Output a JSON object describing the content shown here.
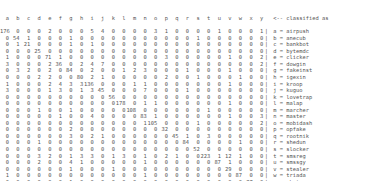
{
  "header": {
    "columns": [
      "a",
      "b",
      "c",
      "d",
      "e",
      "f",
      "g",
      "h",
      "i",
      "j",
      "k",
      "l",
      "m",
      "n",
      "o",
      "p",
      "q",
      "r",
      "s",
      "t",
      "u",
      "v",
      "w",
      "x",
      "y"
    ],
    "trailer": "<-- classified as"
  },
  "rows": [
    {
      "key": "a",
      "name": "airpush",
      "values": [
        176,
        0,
        0,
        0,
        2,
        0,
        0,
        0,
        5,
        4,
        0,
        0,
        0,
        0,
        3,
        1,
        0,
        0,
        0,
        0,
        1,
        0,
        0,
        0,
        1
      ]
    },
    {
      "key": "b",
      "name": "anecub",
      "values": [
        0,
        54,
        1,
        0,
        0,
        0,
        1,
        0,
        0,
        0,
        0,
        0,
        0,
        0,
        0,
        0,
        0,
        0,
        1,
        0,
        0,
        0,
        0,
        0,
        0
      ]
    },
    {
      "key": "c",
      "name": "bankbot",
      "values": [
        0,
        1,
        21,
        0,
        0,
        0,
        1,
        0,
        1,
        0,
        0,
        0,
        0,
        0,
        0,
        0,
        0,
        0,
        0,
        0,
        0,
        0,
        0,
        0,
        0
      ]
    },
    {
      "key": "d",
      "name": "bytemdc",
      "values": [
        0,
        0,
        0,
        25,
        0,
        0,
        0,
        0,
        0,
        0,
        0,
        0,
        0,
        0,
        0,
        0,
        0,
        0,
        0,
        0,
        0,
        0,
        0,
        0,
        0
      ]
    },
    {
      "key": "e",
      "name": "clicker",
      "values": [
        1,
        0,
        0,
        0,
        71,
        1,
        0,
        0,
        0,
        0,
        0,
        0,
        0,
        0,
        0,
        3,
        0,
        0,
        0,
        0,
        0,
        1,
        0,
        0,
        2
      ]
    },
    {
      "key": "f",
      "name": "dowgin",
      "values": [
        3,
        0,
        0,
        0,
        2,
        36,
        0,
        2,
        4,
        7,
        0,
        0,
        0,
        0,
        0,
        0,
        0,
        0,
        0,
        0,
        0,
        0,
        0,
        0,
        2
      ]
    },
    {
      "key": "g",
      "name": "fakeinst",
      "values": [
        0,
        3,
        2,
        0,
        2,
        0,
        84,
        0,
        2,
        0,
        0,
        1,
        2,
        3,
        0,
        0,
        0,
        1,
        0,
        0,
        0,
        1,
        0,
        0,
        0
      ]
    },
    {
      "key": "h",
      "name": "igexin",
      "values": [
        0,
        0,
        0,
        2,
        2,
        0,
        0,
        80,
        2,
        1,
        0,
        0,
        0,
        0,
        0,
        2,
        0,
        0,
        1,
        0,
        0,
        0,
        1,
        0,
        0
      ]
    },
    {
      "key": "i",
      "name": "kroop",
      "values": [
        1,
        0,
        0,
        0,
        2,
        4,
        3,
        3,
        136,
        0,
        0,
        0,
        1,
        1,
        0,
        0,
        0,
        0,
        0,
        0,
        0,
        1,
        0,
        0,
        0
      ]
    },
    {
      "key": "j",
      "name": "kuguo",
      "values": [
        3,
        0,
        0,
        0,
        1,
        3,
        0,
        1,
        3,
        45,
        0,
        0,
        0,
        7,
        0,
        0,
        0,
        1,
        0,
        0,
        0,
        0,
        0,
        0,
        0
      ]
    },
    {
      "key": "k",
      "name": "lovetrap",
      "values": [
        0,
        0,
        0,
        0,
        0,
        0,
        0,
        0,
        0,
        0,
        56,
        0,
        0,
        0,
        0,
        0,
        0,
        0,
        0,
        0,
        0,
        0,
        0,
        0,
        0
      ]
    },
    {
      "key": "l",
      "name": "malap",
      "values": [
        0,
        0,
        0,
        0,
        0,
        0,
        0,
        0,
        0,
        0,
        0,
        178,
        0,
        1,
        1,
        0,
        0,
        0,
        0,
        0,
        0,
        1,
        0,
        0,
        0
      ]
    },
    {
      "key": "m",
      "name": "marcher",
      "values": [
        0,
        0,
        0,
        1,
        0,
        0,
        1,
        0,
        0,
        0,
        0,
        0,
        108,
        0,
        0,
        0,
        0,
        0,
        0,
        1,
        0,
        0,
        0,
        0,
        0
      ]
    },
    {
      "key": "n",
      "name": "master",
      "values": [
        0,
        0,
        0,
        0,
        0,
        1,
        0,
        0,
        4,
        0,
        0,
        0,
        0,
        83,
        1,
        0,
        0,
        0,
        0,
        0,
        0,
        1,
        0,
        0,
        3
      ]
    },
    {
      "key": "o",
      "name": "mobidash",
      "values": [
        0,
        0,
        0,
        0,
        0,
        0,
        0,
        0,
        0,
        0,
        0,
        0,
        0,
        1,
        105,
        0,
        0,
        0,
        1,
        0,
        0,
        0,
        0,
        0,
        2
      ]
    },
    {
      "key": "p",
      "name": "opfake",
      "values": [
        0,
        0,
        0,
        0,
        0,
        0,
        2,
        0,
        0,
        0,
        0,
        0,
        0,
        0,
        0,
        32,
        0,
        0,
        0,
        0,
        0,
        0,
        0,
        0,
        0
      ]
    },
    {
      "key": "q",
      "name": "rootnik",
      "values": [
        0,
        0,
        0,
        0,
        0,
        0,
        3,
        0,
        2,
        1,
        0,
        0,
        0,
        0,
        0,
        0,
        45,
        1,
        0,
        3,
        0,
        0,
        0,
        0,
        0
      ]
    },
    {
      "key": "r",
      "name": "shedun",
      "values": [
        0,
        0,
        0,
        1,
        0,
        0,
        0,
        0,
        0,
        0,
        0,
        0,
        0,
        0,
        0,
        0,
        0,
        84,
        0,
        0,
        0,
        0,
        1,
        0,
        0
      ]
    },
    {
      "key": "s",
      "name": "slocker",
      "values": [
        0,
        0,
        0,
        0,
        0,
        0,
        0,
        0,
        0,
        0,
        0,
        0,
        0,
        0,
        0,
        0,
        0,
        0,
        52,
        0,
        0,
        0,
        0,
        0,
        0
      ]
    },
    {
      "key": "t",
      "name": "smsreg",
      "values": [
        0,
        0,
        0,
        3,
        2,
        0,
        1,
        3,
        3,
        0,
        1,
        3,
        0,
        1,
        0,
        2,
        1,
        0,
        0,
        223,
        1,
        12,
        1,
        0,
        0
      ]
    },
    {
      "key": "u",
      "name": "smssgy",
      "values": [
        0,
        0,
        0,
        2,
        0,
        0,
        4,
        1,
        0,
        0,
        0,
        0,
        0,
        1,
        0,
        0,
        0,
        0,
        0,
        0,
        87,
        1,
        0,
        0,
        0
      ]
    },
    {
      "key": "v",
      "name": "stealer",
      "values": [
        0,
        0,
        0,
        0,
        0,
        0,
        1,
        0,
        0,
        0,
        1,
        0,
        0,
        0,
        0,
        0,
        0,
        0,
        0,
        0,
        0,
        29,
        0,
        0,
        0
      ]
    },
    {
      "key": "w",
      "name": "triada",
      "values": [
        1,
        0,
        0,
        0,
        0,
        0,
        0,
        0,
        0,
        0,
        0,
        0,
        0,
        1,
        0,
        0,
        0,
        0,
        0,
        0,
        0,
        0,
        87,
        0,
        0
      ]
    },
    {
      "key": "x",
      "name": "zbot",
      "values": [
        0,
        0,
        0,
        0,
        0,
        0,
        1,
        0,
        0,
        0,
        0,
        0,
        0,
        0,
        0,
        0,
        0,
        0,
        0,
        0,
        0,
        0,
        0,
        27,
        0
      ]
    },
    {
      "key": "y",
      "name": "youmi",
      "values": [
        1,
        0,
        0,
        0,
        4,
        0,
        2,
        1,
        0,
        0,
        0,
        0,
        0,
        0,
        0,
        0,
        0,
        0,
        0,
        0,
        0,
        0,
        0,
        0,
        5
      ]
    }
  ]
}
